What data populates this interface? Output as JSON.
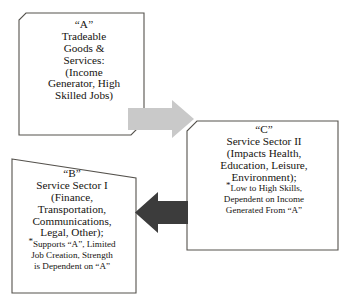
{
  "diagram": {
    "background_color": "#ffffff",
    "box_border_color": "#55524d",
    "text_color": "#15130f",
    "boxes": [
      {
        "id": "box-a",
        "tag": "“A”",
        "lines": [
          "“A”",
          "Tradeable",
          "Goods &",
          "Services:",
          "(Income",
          "Generator, High",
          "Skilled Jobs)"
        ],
        "notes": []
      },
      {
        "id": "box-b",
        "tag": "“B”",
        "lines": [
          "“B”",
          "Service Sector I",
          "(Finance,",
          "Transportation,",
          "Communications,",
          "Legal, Other);"
        ],
        "notes": [
          "Supports “A”, Limited",
          "Job Creation, Strength",
          "is Dependent on “A”"
        ]
      },
      {
        "id": "box-c",
        "tag": "“C”",
        "lines": [
          "“C”",
          "Service Sector II",
          "(Impacts Health,",
          "Education, Leisure,",
          "Environment);"
        ],
        "notes": [
          "Low to High Skills,",
          "Dependent on Income",
          "Generated From “A”"
        ]
      }
    ],
    "arrows": [
      {
        "id": "arrow-a-to-c",
        "label": "arrow from A to C",
        "direction": "right",
        "color": "#c9c9c9"
      },
      {
        "id": "arrow-c-to-b",
        "label": "arrow from C to B",
        "direction": "left",
        "color": "#3c3c3c"
      }
    ]
  }
}
